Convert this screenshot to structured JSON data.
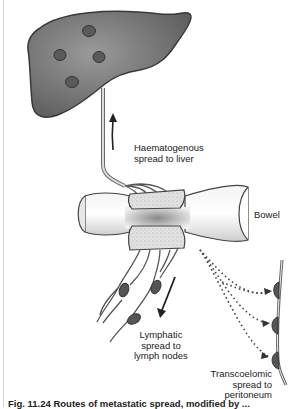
{
  "figure": {
    "labels": {
      "haematogenous": "Haematogenous\nspread to liver",
      "bowel": "Bowel",
      "lymphatic": "Lymphatic\nspread to\nlymph nodes",
      "transcoelomic": "Transcoelomic\nspread to\nperitoneum"
    },
    "caption": "Fig. 11.24  Routes of metastatic spread, modified by ...",
    "colors": {
      "liver": "#707070",
      "liver_edge": "#3a3a3a",
      "metastasis": "#5a5a5a",
      "bowel": "#e6e6e6",
      "tumour": "#d9d9d9",
      "node": "#555555"
    }
  }
}
